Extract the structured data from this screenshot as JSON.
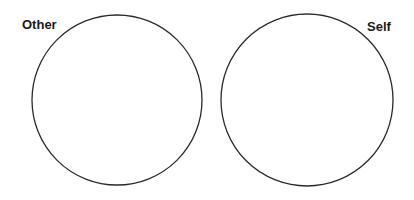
{
  "diagram": {
    "type": "two-circle comparison",
    "circles": [
      {
        "label": "Other",
        "cx": 117,
        "cy": 100,
        "r": 85
      },
      {
        "label": "Self",
        "cx": 307,
        "cy": 100,
        "r": 86
      }
    ],
    "stroke_color": "#2a2a2a",
    "background_color": "#ffffff"
  }
}
